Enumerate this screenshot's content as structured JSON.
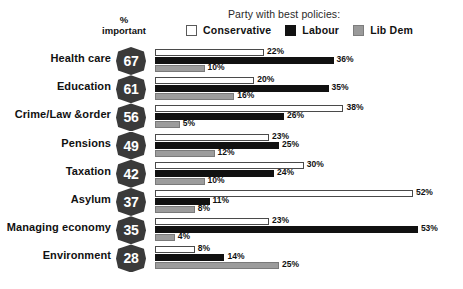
{
  "legend": {
    "title": "Party with best policies:",
    "items": [
      {
        "label": "Conservative",
        "key": "con",
        "color": "#ffffff"
      },
      {
        "label": "Labour",
        "key": "lab",
        "color": "#111111"
      },
      {
        "label": "Lib Dem",
        "key": "lib",
        "color": "#9c9c9c"
      }
    ]
  },
  "pct_caption": {
    "line1": "%",
    "line2": "important"
  },
  "chart_data": {
    "type": "bar",
    "orientation": "horizontal",
    "title": "",
    "subtitle": "",
    "xlabel": "",
    "ylabel": "",
    "xlim": [
      0,
      53
    ],
    "grid": false,
    "legend_position": "top",
    "categories": [
      "Health care",
      "Education",
      "Crime/Law &order",
      "Pensions",
      "Taxation",
      "Asylum",
      "Managing economy",
      "Environment"
    ],
    "importance": [
      67,
      61,
      56,
      49,
      42,
      37,
      35,
      28
    ],
    "importance_label": "% important",
    "series": [
      {
        "name": "Conservative",
        "color": "#ffffff",
        "values": [
          22,
          20,
          38,
          23,
          30,
          52,
          23,
          8
        ],
        "labels": [
          "22%",
          "20%",
          "38%",
          "23%",
          "30%",
          "52%",
          "23%",
          "8%"
        ]
      },
      {
        "name": "Labour",
        "color": "#111111",
        "values": [
          36,
          35,
          26,
          25,
          24,
          11,
          53,
          14
        ],
        "labels": [
          "36%",
          "35%",
          "26%",
          "25%",
          "24%",
          "11%",
          "53%",
          "14%"
        ]
      },
      {
        "name": "Lib Dem",
        "color": "#9c9c9c",
        "values": [
          10,
          16,
          5,
          12,
          10,
          8,
          4,
          25
        ],
        "labels": [
          "10%",
          "16%",
          "5%",
          "12%",
          "10%",
          "8%",
          "4%",
          "25%"
        ]
      }
    ]
  }
}
